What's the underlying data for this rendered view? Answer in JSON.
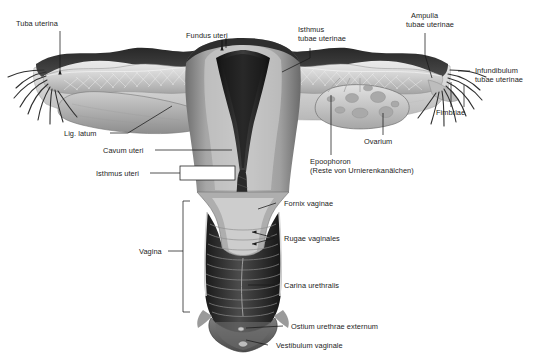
{
  "figure": {
    "background_color": "#ffffff",
    "line_color": "#1a1a1a",
    "label_color": "#1d1d1d"
  },
  "labels": {
    "tuba_uterina": "Tuba uterina",
    "fundus_uteri": "Fundus uteri",
    "isthmus_tubae_line1": "Isthmus",
    "isthmus_tubae_line2": "tubae uterinae",
    "ampulla_line1": "Ampulla",
    "ampulla_line2": "tubae uterinae",
    "infundibulum_line1": "Infundibulum",
    "infundibulum_line2": "tubae uterinae",
    "fimbriae": "Fimbriae",
    "lig_latum": "Lig. latum",
    "cavum_uteri": "Cavum uteri",
    "isthmus_uteri": "Isthmus uteri",
    "ovarium": "Ovarium",
    "epoophoron_line1": "Epoophoron",
    "epoophoron_line2": "(Reste von Urnierenkanälchen)",
    "fornix_vaginae": "Fornix vaginae",
    "rugae_vaginales": "Rugae vaginales",
    "carina_urethralis": "Carina urethralis",
    "vagina": "Vagina",
    "ostium_urethrae": "Ostium urethrae externum",
    "vestibulum_vaginale": "Vestibulum vaginale"
  },
  "structures": {
    "uterus_body": "uterus-corpus",
    "uterine_cavity": "cavum-uteri-cavity",
    "cervix": "cervix-uteri",
    "vaginal_canal": "vagina-lumen",
    "left_tube": "left-uterine-tube",
    "right_tube": "right-uterine-tube",
    "left_ovary": "left-ovary",
    "right_ovary": "right-ovary",
    "left_fimbriae": "left-fimbriae",
    "right_fimbriae": "right-fimbriae",
    "broad_ligament": "lig-latum-sheet",
    "epoophoron_body": "epoophoron-tubules",
    "vestibule": "vestibulum",
    "urethral_orifice": "ostium-urethrae-externum"
  },
  "palette": {
    "serosa_dark": "#2b2b2b",
    "myometrium_mid": "#8d8d8d",
    "myometrium_light": "#c9c9c9",
    "endometrium_dark": "#3a3a3a",
    "cavity_black": "#1c1c1c",
    "ligament_pale": "#dcdcdc",
    "ovary_fill": "#b9b9b9",
    "mucosa_grey": "#a8a8a8"
  },
  "brackets": {
    "vagina_bracket": "vagina-span-bracket",
    "isthmus_box": "isthmus-uteri-box"
  }
}
